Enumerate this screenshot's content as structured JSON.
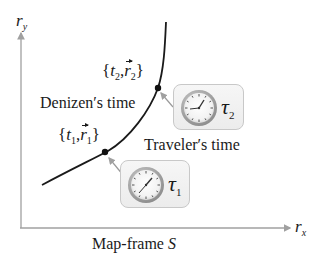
{
  "axes": {
    "y_label": "r",
    "y_sub": "y",
    "x_label": "r",
    "x_sub": "x"
  },
  "frame_caption": {
    "text": "Map-frame ",
    "symbol": "S"
  },
  "labels": {
    "denizen": "Denizen′s time",
    "traveler": "Traveler′s time"
  },
  "events": [
    {
      "t": "t",
      "sub": "1",
      "r": "r",
      "r_sub": "1"
    },
    {
      "t": "t",
      "sub": "2",
      "r": "r",
      "r_sub": "2"
    }
  ],
  "clocks": [
    {
      "symbol": "τ",
      "sub": "1"
    },
    {
      "symbol": "τ",
      "sub": "2"
    }
  ],
  "colors": {
    "axis": "#a0a0a0",
    "curve": "#1a1a1a",
    "pointer": "#9a9a9a",
    "clock_box_border": "#c8c8c8"
  }
}
